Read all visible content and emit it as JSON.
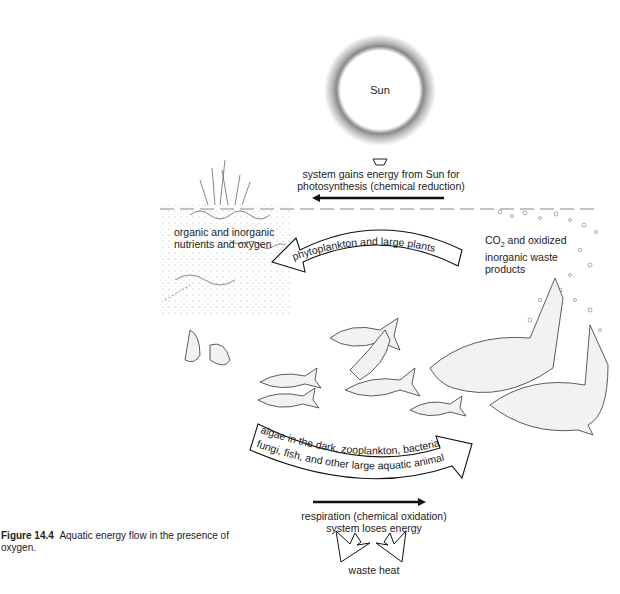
{
  "figure": {
    "number_label": "Figure 14.4",
    "caption": "Aquatic energy flow in the presence of oxygen."
  },
  "sun": {
    "label": "Sun"
  },
  "top": {
    "line1": "system gains energy from Sun for",
    "line2": "photosynthesis (chemical reduction)"
  },
  "left_label": {
    "line1": "organic and inorganic",
    "line2": "nutrients and oxygen"
  },
  "right_label": {
    "line1_prefix": "CO",
    "line1_sub": "2",
    "line1_suffix": " and oxidized",
    "line2": "inorganic waste",
    "line3": "products"
  },
  "upper_arrow": {
    "text": "phytoplankton and large plants"
  },
  "lower_arrow": {
    "line1": "algae in the dark, zooplankton, bacteria,",
    "line2": "fungi, fish, and other large aquatic animals"
  },
  "bottom": {
    "line1": "respiration (chemical oxidation)",
    "line2": "system loses energy",
    "line3": "waste heat"
  },
  "colors": {
    "ink": "#1a1a1a",
    "paper": "#ffffff",
    "stipple": "#7a7a7a"
  }
}
